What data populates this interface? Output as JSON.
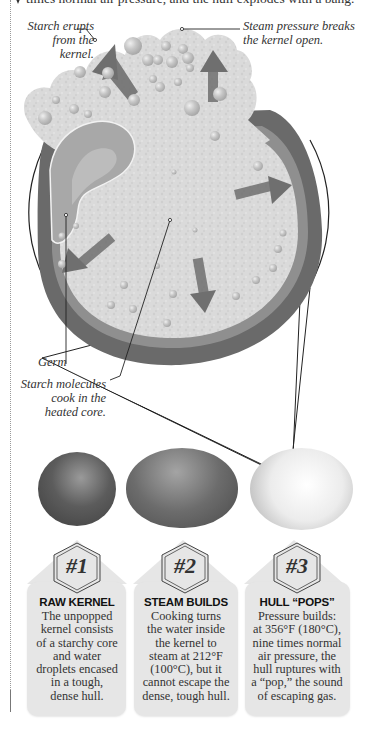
{
  "intro": {
    "text": "times normal air pressure, and the hull explodes with a bang."
  },
  "diagram": {
    "callouts": {
      "starch_erupts": [
        "Starch erupts",
        "from the kernel."
      ],
      "steam_pressure": [
        "Steam pressure breaks",
        "the kernel open."
      ],
      "germ": "Germ",
      "starch_molecules": [
        "Starch molecules",
        "cook in the",
        "heated core."
      ]
    },
    "colors": {
      "hull": "#6a6a6a",
      "hull_inner": "#8c8c8c",
      "starch": "#d8d8d8",
      "germ": "#a8a8a8",
      "arrow": "#7a7a7a",
      "bubble": "#c4c4c4"
    }
  },
  "stages": [
    {
      "number": "#1",
      "title": "RAW KERNEL",
      "body": [
        "The unpopped",
        "kernel consists",
        "of a starchy core",
        "and water",
        "droplets encased",
        "in a tough,",
        "dense hull."
      ]
    },
    {
      "number": "#2",
      "title": "STEAM BUILDS",
      "body": [
        "Cooking turns",
        "the water inside",
        "the kernel to",
        "steam at 212°F",
        "(100°C), but it",
        "cannot escape the",
        "dense, tough hull."
      ]
    },
    {
      "number": "#3",
      "title": "HULL “POPS”",
      "body": [
        "Pressure builds:",
        "at 356°F (180°C),",
        "nine times normal",
        "air pressure, the",
        "hull ruptures with",
        "a “pop,” the sound",
        "of escaping gas."
      ]
    }
  ]
}
